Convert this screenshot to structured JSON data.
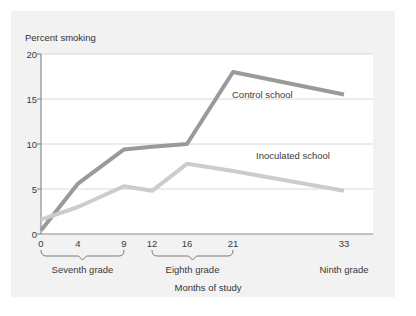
{
  "figure": {
    "background": "#ffffff",
    "panel_color": "#f2f2f2",
    "plot_background": "#ffffff"
  },
  "chart_data": {
    "type": "line",
    "title": "",
    "ylabel": "Percent smoking",
    "xlabel": "Months of study",
    "ylim": [
      0,
      20
    ],
    "yticks": [
      "0",
      "5",
      "10",
      "15",
      "20"
    ],
    "ytick_values": [
      0,
      5,
      10,
      15,
      20
    ],
    "xlim": [
      0,
      36
    ],
    "xticks": [
      "0",
      "4",
      "9",
      "12",
      "16",
      "21",
      "33"
    ],
    "xtick_values": [
      0,
      4,
      9,
      12,
      16,
      21,
      33
    ],
    "grid": "horizontal",
    "legend_position": "inline-annotation",
    "x": [
      0,
      4,
      9,
      12,
      16,
      21,
      33
    ],
    "series": [
      {
        "name": "Control school",
        "color": "#9a9a9a",
        "values": [
          0.4,
          5.6,
          9.4,
          9.7,
          10.0,
          18.0,
          15.5
        ]
      },
      {
        "name": "Inoculated school",
        "color": "#cccccc",
        "values": [
          1.6,
          3.0,
          5.3,
          4.8,
          7.8,
          7.0,
          4.8
        ]
      }
    ],
    "group_brackets": [
      {
        "label": "Seventh grade",
        "from": 0,
        "to": 9
      },
      {
        "label": "Eighth grade",
        "from": 12,
        "to": 21
      },
      {
        "label": "Ninth grade",
        "from": 33,
        "to": 33,
        "bracket": false
      }
    ]
  },
  "labels": {
    "y_axis_title": "Percent smoking",
    "x_axis_title": "Months of study",
    "control_annotation": "Control school",
    "inoculated_annotation": "Inoculated school"
  }
}
